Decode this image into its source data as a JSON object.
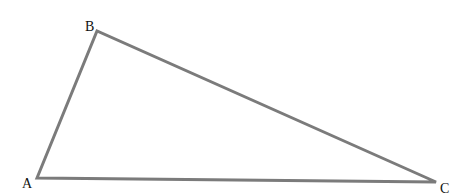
{
  "diagram": {
    "type": "triangle",
    "stroke_color": "#7b7b7b",
    "stroke_width": 3,
    "label_color": "#111111",
    "vertices": [
      {
        "id": "A",
        "label": "A",
        "x": 37,
        "y": 178,
        "label_x": 22,
        "label_y": 188
      },
      {
        "id": "B",
        "label": "B",
        "x": 97,
        "y": 31,
        "label_x": 85,
        "label_y": 31
      },
      {
        "id": "C",
        "label": "C",
        "x": 436,
        "y": 182,
        "label_x": 440,
        "label_y": 193
      }
    ],
    "edges": [
      {
        "from": "A",
        "to": "B"
      },
      {
        "from": "B",
        "to": "C"
      },
      {
        "from": "C",
        "to": "A"
      }
    ]
  }
}
